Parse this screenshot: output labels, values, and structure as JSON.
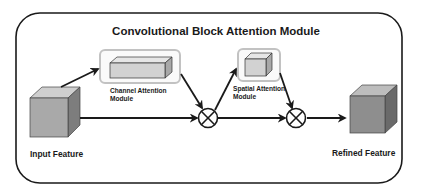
{
  "title": "Convolutional Block Attention Module",
  "nodes": {
    "input": {
      "label": "Input Feature",
      "color": "#a9a9a9"
    },
    "channel_attention": {
      "label_line1": "Channel Attention",
      "label_line2": "Module",
      "color": "#d4d4d4"
    },
    "spatial_attention": {
      "label_line1": "Spatial Attention",
      "label_line2": "Module",
      "color": "#d4d4d4"
    },
    "refined": {
      "label": "Refined Feature",
      "color": "#8e8e8e"
    }
  },
  "operators": [
    {
      "symbol": "multiply",
      "name": "elementwise-multiply-1"
    },
    {
      "symbol": "multiply",
      "name": "elementwise-multiply-2"
    }
  ],
  "colors": {
    "frame": "#1a1a1a",
    "module_border": "#bdbdbd",
    "arrow": "#1a1a1a"
  }
}
